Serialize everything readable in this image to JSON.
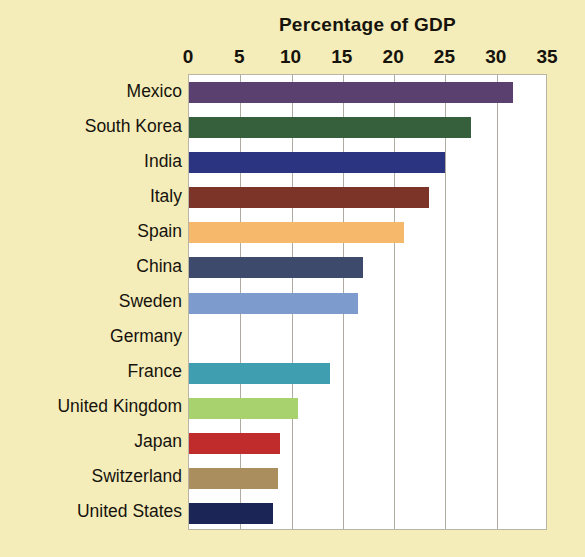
{
  "chart_data": {
    "type": "bar",
    "orientation": "horizontal",
    "title": "Percentage of GDP",
    "subtitle": "",
    "xlabel": "",
    "ylabel": "",
    "xlim": [
      0,
      35
    ],
    "ylim": null,
    "grid": true,
    "legend": false,
    "legend_position": "none",
    "xticks": [
      0,
      5,
      10,
      15,
      20,
      25,
      30,
      35
    ],
    "xtick_labels": [
      "0",
      "5",
      "10",
      "15",
      "20",
      "25",
      "30",
      "35"
    ],
    "categories": [
      "Mexico",
      "South Korea",
      "India",
      "Italy",
      "Spain",
      "China",
      "Sweden",
      "Germany",
      "France",
      "United Kingdom",
      "Japan",
      "Switzerland",
      "United States"
    ],
    "values": [
      31.6,
      27.5,
      25.0,
      23.4,
      21.0,
      17.0,
      16.5,
      15.5,
      13.7,
      10.6,
      8.9,
      8.7,
      8.2
    ],
    "bar_colors": [
      "#59406f",
      "#36603c",
      "#2b3480",
      "#7c3328",
      "#f6b96b",
      "#3d4a6b",
      "#7d9ccd",
      "#47a martinez",
      "#3f9fb0",
      "#a8d26e",
      "#c02c2c",
      "#ab8e5e",
      "#1b2556"
    ],
    "background_color": "#f5edb9",
    "plot_background_color": "#ffffff",
    "gridline_color": "#b0aba0",
    "text_color": "#16130d"
  }
}
